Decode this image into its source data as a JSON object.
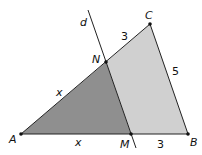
{
  "diagram": {
    "points": {
      "A": {
        "label": "A",
        "x": 21,
        "y": 134
      },
      "M": {
        "label": "M",
        "x": 131,
        "y": 134
      },
      "B": {
        "label": "B",
        "x": 188,
        "y": 134
      },
      "C": {
        "label": "C",
        "x": 150,
        "y": 24
      },
      "N": {
        "label": "N",
        "x": 106,
        "y": 62
      }
    },
    "line_d": {
      "label": "d",
      "x1": 88,
      "y1": 10,
      "x2": 136,
      "y2": 148
    },
    "segment_labels": {
      "AN": "x",
      "AM": "x",
      "NC": "3",
      "MB": "3",
      "CB": "5"
    },
    "colors": {
      "dark_region": "#8c8c8c",
      "light_region": "#cfcfcf",
      "stroke": "#222222"
    }
  }
}
